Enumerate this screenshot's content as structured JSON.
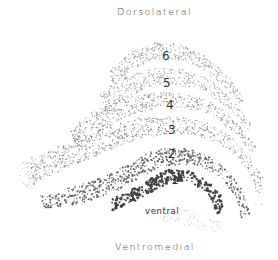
{
  "labels": {
    "top": "Dorsolateral",
    "bottom": "Ventromedial",
    "inner": "ventral"
  },
  "layers": [
    {
      "num": "6",
      "x": 162,
      "y": 50
    },
    {
      "num": "5",
      "x": 163,
      "y": 77
    },
    {
      "num": "4",
      "x": 166,
      "y": 99
    },
    {
      "num": "3",
      "x": 168,
      "y": 124
    },
    {
      "num": "2",
      "x": 168,
      "y": 148
    },
    {
      "num": "1",
      "x": 170,
      "y": 174
    }
  ],
  "colors": {
    "background": "#ffffff",
    "ink": "#222222",
    "text": "#444444"
  },
  "bands": [
    {
      "name": "layer-6",
      "density": 520,
      "dotMin": 0.35,
      "dotMax": 0.7,
      "opacity": 0.45,
      "outer": [
        [
          110,
          70
        ],
        [
          130,
          52
        ],
        [
          155,
          42
        ],
        [
          180,
          44
        ],
        [
          205,
          56
        ],
        [
          228,
          76
        ],
        [
          246,
          100
        ]
      ],
      "inner": [
        [
          240,
          104
        ],
        [
          222,
          84
        ],
        [
          200,
          68
        ],
        [
          178,
          60
        ],
        [
          155,
          60
        ],
        [
          132,
          70
        ],
        [
          112,
          86
        ]
      ]
    },
    {
      "name": "layer-5",
      "density": 520,
      "dotMin": 0.35,
      "dotMax": 0.7,
      "opacity": 0.45,
      "outer": [
        [
          100,
          92
        ],
        [
          125,
          76
        ],
        [
          155,
          68
        ],
        [
          182,
          68
        ],
        [
          208,
          78
        ],
        [
          232,
          98
        ],
        [
          252,
          124
        ]
      ],
      "inner": [
        [
          248,
          130
        ],
        [
          228,
          108
        ],
        [
          205,
          92
        ],
        [
          180,
          86
        ],
        [
          155,
          86
        ],
        [
          128,
          96
        ],
        [
          104,
          112
        ]
      ]
    },
    {
      "name": "layer-4",
      "density": 620,
      "dotMin": 0.35,
      "dotMax": 0.75,
      "opacity": 0.5,
      "outer": [
        [
          70,
          130
        ],
        [
          92,
          112
        ],
        [
          125,
          98
        ],
        [
          158,
          92
        ],
        [
          188,
          94
        ],
        [
          215,
          104
        ],
        [
          240,
          124
        ],
        [
          258,
          148
        ]
      ],
      "inner": [
        [
          255,
          156
        ],
        [
          236,
          134
        ],
        [
          212,
          116
        ],
        [
          186,
          108
        ],
        [
          158,
          108
        ],
        [
          128,
          116
        ],
        [
          98,
          132
        ],
        [
          76,
          150
        ]
      ]
    },
    {
      "name": "layer-3",
      "density": 820,
      "dotMin": 0.35,
      "dotMax": 0.8,
      "opacity": 0.5,
      "outer": [
        [
          30,
          160
        ],
        [
          55,
          148
        ],
        [
          80,
          138
        ],
        [
          110,
          126
        ],
        [
          140,
          118
        ],
        [
          172,
          116
        ],
        [
          202,
          120
        ],
        [
          228,
          134
        ],
        [
          250,
          156
        ],
        [
          263,
          178
        ],
        [
          262,
          205
        ]
      ],
      "inner": [
        [
          255,
          204
        ],
        [
          254,
          180
        ],
        [
          240,
          160
        ],
        [
          218,
          142
        ],
        [
          192,
          134
        ],
        [
          165,
          134
        ],
        [
          135,
          140
        ],
        [
          105,
          152
        ],
        [
          78,
          164
        ],
        [
          50,
          176
        ],
        [
          34,
          184
        ]
      ]
    },
    {
      "name": "layer-2",
      "density": 640,
      "dotMin": 0.45,
      "dotMax": 1.1,
      "opacity": 0.7,
      "outer": [
        [
          40,
          196
        ],
        [
          62,
          190
        ],
        [
          90,
          182
        ],
        [
          118,
          170
        ],
        [
          140,
          156
        ],
        [
          162,
          148
        ],
        [
          186,
          148
        ],
        [
          208,
          156
        ],
        [
          228,
          170
        ],
        [
          244,
          190
        ],
        [
          250,
          215
        ]
      ],
      "inner": [
        [
          240,
          218
        ],
        [
          236,
          196
        ],
        [
          222,
          180
        ],
        [
          204,
          168
        ],
        [
          184,
          164
        ],
        [
          162,
          166
        ],
        [
          142,
          176
        ],
        [
          120,
          190
        ],
        [
          94,
          200
        ],
        [
          66,
          206
        ],
        [
          44,
          208
        ]
      ]
    },
    {
      "name": "layer-1",
      "density": 260,
      "dotMin": 0.8,
      "dotMax": 1.6,
      "opacity": 0.85,
      "outer": [
        [
          110,
          200
        ],
        [
          128,
          192
        ],
        [
          148,
          180
        ],
        [
          166,
          170
        ],
        [
          186,
          170
        ],
        [
          204,
          178
        ],
        [
          220,
          194
        ],
        [
          228,
          212
        ]
      ],
      "inner": [
        [
          216,
          214
        ],
        [
          212,
          200
        ],
        [
          200,
          188
        ],
        [
          184,
          182
        ],
        [
          166,
          184
        ],
        [
          148,
          194
        ],
        [
          130,
          204
        ],
        [
          112,
          210
        ]
      ]
    },
    {
      "name": "faint-tail",
      "density": 140,
      "dotMin": 0.3,
      "dotMax": 0.6,
      "opacity": 0.35,
      "outer": [
        [
          18,
          165
        ],
        [
          30,
          158
        ],
        [
          60,
          150
        ],
        [
          70,
          140
        ],
        [
          70,
          160
        ],
        [
          40,
          180
        ],
        [
          30,
          190
        ],
        [
          20,
          180
        ]
      ],
      "inner": []
    },
    {
      "name": "faint-bottom",
      "density": 120,
      "dotMin": 0.3,
      "dotMax": 0.6,
      "opacity": 0.3,
      "outer": [
        [
          150,
          210
        ],
        [
          175,
          205
        ],
        [
          205,
          215
        ],
        [
          230,
          225
        ],
        [
          215,
          232
        ],
        [
          185,
          225
        ],
        [
          160,
          222
        ]
      ],
      "inner": []
    }
  ]
}
